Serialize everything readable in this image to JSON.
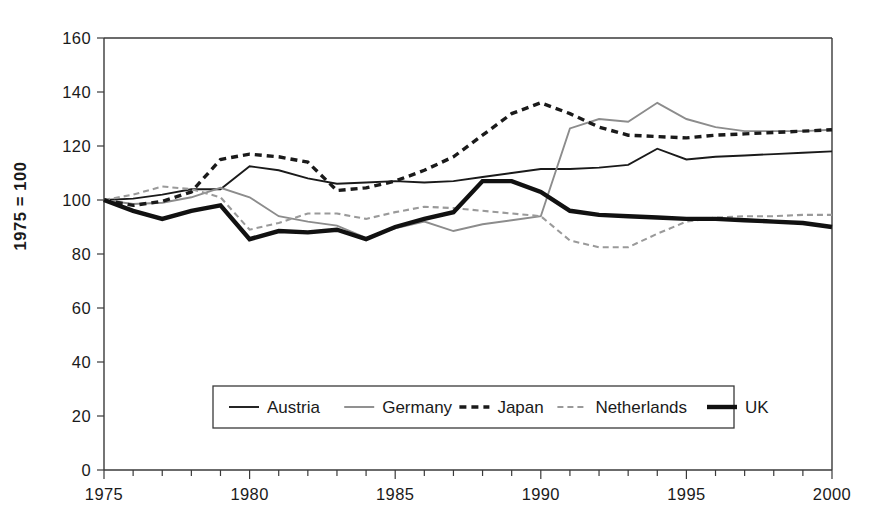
{
  "chart_data": {
    "type": "line",
    "title": "",
    "subtitle": "",
    "xlabel": "",
    "ylabel": "1975 = 100",
    "xlim": [
      1975,
      2000
    ],
    "ylim": [
      0,
      160
    ],
    "y_ticks": [
      0,
      20,
      40,
      60,
      80,
      100,
      120,
      140,
      160
    ],
    "y_tick_labels": [
      "0",
      "20",
      "40",
      "60",
      "80",
      "100",
      "120",
      "140",
      "160"
    ],
    "x_ticks": [
      1975,
      1980,
      1985,
      1990,
      1995,
      2000
    ],
    "x_tick_labels": [
      "1975",
      "1980",
      "1985",
      "1990",
      "1995",
      "2000"
    ],
    "x_minor_tick_step": 1,
    "grid": false,
    "legend_position": "bottom-center",
    "x": [
      1975,
      1976,
      1977,
      1978,
      1979,
      1980,
      1981,
      1982,
      1983,
      1984,
      1985,
      1986,
      1987,
      1988,
      1989,
      1990,
      1991,
      1992,
      1993,
      1994,
      1995,
      1996,
      1997,
      1998,
      1999,
      2000
    ],
    "series": [
      {
        "name": "Austria",
        "color": "#1a1a1a",
        "style": "solid-thin",
        "stroke_width": 1.9,
        "dash": "none",
        "values": [
          100,
          100.5,
          102,
          104,
          104,
          112.5,
          111,
          108,
          106,
          106.5,
          107,
          106.5,
          107,
          108.5,
          110,
          111.5,
          111.5,
          112,
          113,
          119,
          115,
          116,
          116.5,
          117,
          117.5,
          118
        ]
      },
      {
        "name": "Germany",
        "color": "#8c8c8c",
        "style": "solid-thin-gray",
        "stroke_width": 1.9,
        "dash": "none",
        "values": [
          100,
          98.5,
          99,
          101,
          104.5,
          101,
          94,
          92,
          90.5,
          86,
          89.5,
          92,
          88.5,
          91,
          92.5,
          94,
          126.5,
          130,
          129,
          136,
          130,
          127,
          125.5,
          125.5,
          125.5,
          126
        ]
      },
      {
        "name": "Japan",
        "color": "#1a1a1a",
        "style": "dashed-bold",
        "stroke_width": 3.4,
        "dash": "7,5",
        "values": [
          100,
          98,
          99.5,
          103,
          115,
          117,
          116,
          114,
          103.5,
          104.5,
          107,
          111,
          116,
          124,
          132,
          136,
          132,
          127,
          124,
          123.5,
          123,
          124,
          124.5,
          125,
          125.5,
          126
        ]
      },
      {
        "name": "Netherlands",
        "color": "#9a9a9a",
        "style": "dashed-thin-gray",
        "stroke_width": 2.1,
        "dash": "6,4",
        "values": [
          100,
          102,
          105,
          104,
          101,
          89,
          91.5,
          95,
          95,
          93,
          95.5,
          97.5,
          97,
          96,
          95,
          94,
          85,
          82.5,
          82.5,
          87.5,
          92,
          93.5,
          94,
          94,
          94.5,
          94.5
        ]
      },
      {
        "name": "UK",
        "color": "#111111",
        "style": "solid-thick",
        "stroke_width": 4.4,
        "dash": "none",
        "values": [
          100,
          96,
          93,
          96,
          98,
          85.5,
          88.5,
          88,
          89,
          85.5,
          90,
          93,
          95.5,
          107,
          107,
          103,
          96,
          94.5,
          94,
          93.5,
          93,
          93,
          92.5,
          92,
          91.5,
          90
        ]
      }
    ]
  },
  "legend": {
    "entries": [
      {
        "label": "Austria"
      },
      {
        "label": "Germany"
      },
      {
        "label": "Japan"
      },
      {
        "label": "Netherlands"
      },
      {
        "label": "UK"
      }
    ]
  }
}
